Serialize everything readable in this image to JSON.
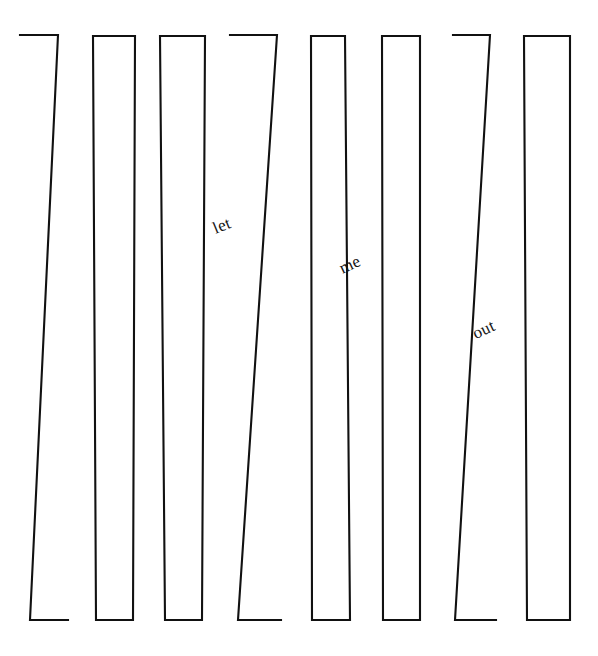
{
  "canvas": {
    "width": 598,
    "height": 656,
    "background_color": "#ffffff",
    "stroke_color": "#111111",
    "stroke_width": 2.1,
    "title": "let me out"
  },
  "artwork": {
    "kind": "line-drawing",
    "description": "Eight tall narrow bars resembling prison bars or fence slats; three slanted bars have open gaps at top-left and bottom-right.",
    "bar_count": 8,
    "hidden_message": "let me out"
  },
  "bars": [
    {
      "id": "bar-1",
      "style": "slanted-open",
      "open_ends": [
        "top-left",
        "bottom-right"
      ],
      "path": "M 20 35 L 58 35 L 30 620 L 68 620"
    },
    {
      "id": "bar-2",
      "style": "closed",
      "open_ends": [],
      "path": "M 93 36 L 135 36 L 133 620 L 96 620 Z"
    },
    {
      "id": "bar-3",
      "style": "closed",
      "open_ends": [],
      "path": "M 160 36 L 205 36 L 202 620 L 165 620 Z"
    },
    {
      "id": "bar-4",
      "style": "slanted-open",
      "open_ends": [
        "top-left",
        "bottom-right"
      ],
      "path": "M 230 35 L 277 35 L 238 620 L 281 620"
    },
    {
      "id": "bar-5",
      "style": "closed",
      "open_ends": [],
      "path": "M 311 36 L 345 36 L 350 620 L 312 620 Z"
    },
    {
      "id": "bar-6",
      "style": "closed",
      "open_ends": [],
      "path": "M 382 36 L 420 36 L 420 620 L 383 620 Z"
    },
    {
      "id": "bar-7",
      "style": "slanted-open",
      "open_ends": [
        "top-left",
        "bottom-right"
      ],
      "path": "M 453 35 L 490 35 L 455 620 L 496 620"
    },
    {
      "id": "bar-8",
      "style": "closed",
      "open_ends": [],
      "path": "M 524 36 L 570 36 L 570 620 L 527 620 Z"
    }
  ],
  "words": [
    {
      "id": "word-let",
      "text": "let",
      "x": 222,
      "y": 226,
      "rotation_deg": -22,
      "font_size": 17
    },
    {
      "id": "word-me",
      "text": "me",
      "x": 350,
      "y": 265,
      "rotation_deg": -25,
      "font_size": 17
    },
    {
      "id": "word-out",
      "text": "out",
      "x": 484,
      "y": 330,
      "rotation_deg": -25,
      "font_size": 17
    }
  ]
}
